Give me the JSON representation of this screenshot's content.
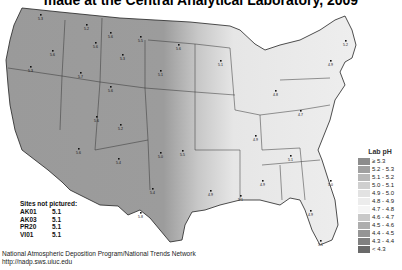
{
  "title": "made at the Central Analytical Laboratory, 2009",
  "legend": {
    "title": "Lab pH",
    "items": [
      {
        "label": "≥ 5.3",
        "color": "#8c8c8c"
      },
      {
        "label": "5.2 - 5.3",
        "color": "#a0a0a0"
      },
      {
        "label": "5.1 - 5.2",
        "color": "#b8b8b8"
      },
      {
        "label": "5.0 - 5.1",
        "color": "#cfcfcf"
      },
      {
        "label": "4.9 - 5.0",
        "color": "#e2e2e2"
      },
      {
        "label": "4.8 - 4.9",
        "color": "#ececec"
      },
      {
        "label": "4.7 - 4.8",
        "color": "#f5f5f5"
      },
      {
        "label": "4.6 - 4.7",
        "color": "#c8c8c8"
      },
      {
        "label": "4.5 - 4.6",
        "color": "#adadad"
      },
      {
        "label": "4.4 - 4.5",
        "color": "#959595"
      },
      {
        "label": "4.3 - 4.4",
        "color": "#808080"
      },
      {
        "label": "< 4.3",
        "color": "#6a6a6a"
      }
    ]
  },
  "sites_not_pictured": {
    "title": "Sites not pictured:",
    "sites": [
      {
        "id": "AK01",
        "value": "5.1"
      },
      {
        "id": "AK03",
        "value": "5.1"
      },
      {
        "id": "PR20",
        "value": "5.1"
      },
      {
        "id": "VI01",
        "value": "5.1"
      }
    ]
  },
  "footer": {
    "line1": "National Atmospheric Deposition Program/National Trends Network",
    "line2": "http://nadp.sws.uiuc.edu"
  },
  "map": {
    "west_color": "#9a9a9a",
    "transition_color": "#c4c4c4",
    "east_color": "#ececec",
    "border_color": "#222222",
    "sample_labels": [
      {
        "x": 40,
        "y": 14,
        "v": "5.3"
      },
      {
        "x": 86,
        "y": 24,
        "v": "5.2"
      },
      {
        "x": 110,
        "y": 32,
        "v": "5.6"
      },
      {
        "x": 140,
        "y": 36,
        "v": "5.5"
      },
      {
        "x": 178,
        "y": 44,
        "v": "5.6"
      },
      {
        "x": 95,
        "y": 42,
        "v": "5.6"
      },
      {
        "x": 52,
        "y": 50,
        "v": "5.6"
      },
      {
        "x": 80,
        "y": 72,
        "v": "5.7"
      },
      {
        "x": 122,
        "y": 54,
        "v": "5.3"
      },
      {
        "x": 160,
        "y": 70,
        "v": "5.1"
      },
      {
        "x": 30,
        "y": 66,
        "v": "5.3"
      },
      {
        "x": 110,
        "y": 86,
        "v": "5.6"
      },
      {
        "x": 96,
        "y": 116,
        "v": "5.6"
      },
      {
        "x": 120,
        "y": 124,
        "v": "5.2"
      },
      {
        "x": 78,
        "y": 148,
        "v": "5.6"
      },
      {
        "x": 118,
        "y": 158,
        "v": "5.4"
      },
      {
        "x": 160,
        "y": 152,
        "v": "5.0"
      },
      {
        "x": 182,
        "y": 150,
        "v": "5.5"
      },
      {
        "x": 152,
        "y": 188,
        "v": "5.4"
      },
      {
        "x": 140,
        "y": 212,
        "v": "5.8"
      },
      {
        "x": 220,
        "y": 60,
        "v": "5.1"
      },
      {
        "x": 275,
        "y": 90,
        "v": "4.8"
      },
      {
        "x": 300,
        "y": 110,
        "v": "4.7"
      },
      {
        "x": 330,
        "y": 60,
        "v": "4.9"
      },
      {
        "x": 345,
        "y": 40,
        "v": "5.2"
      },
      {
        "x": 255,
        "y": 135,
        "v": "4.9"
      },
      {
        "x": 290,
        "y": 155,
        "v": "5.1"
      },
      {
        "x": 330,
        "y": 180,
        "v": "5.0"
      },
      {
        "x": 310,
        "y": 210,
        "v": "4.9"
      },
      {
        "x": 320,
        "y": 240,
        "v": "5.1"
      },
      {
        "x": 262,
        "y": 180,
        "v": "4.9"
      },
      {
        "x": 240,
        "y": 195,
        "v": "5.1"
      },
      {
        "x": 210,
        "y": 190,
        "v": "4.9"
      }
    ]
  }
}
